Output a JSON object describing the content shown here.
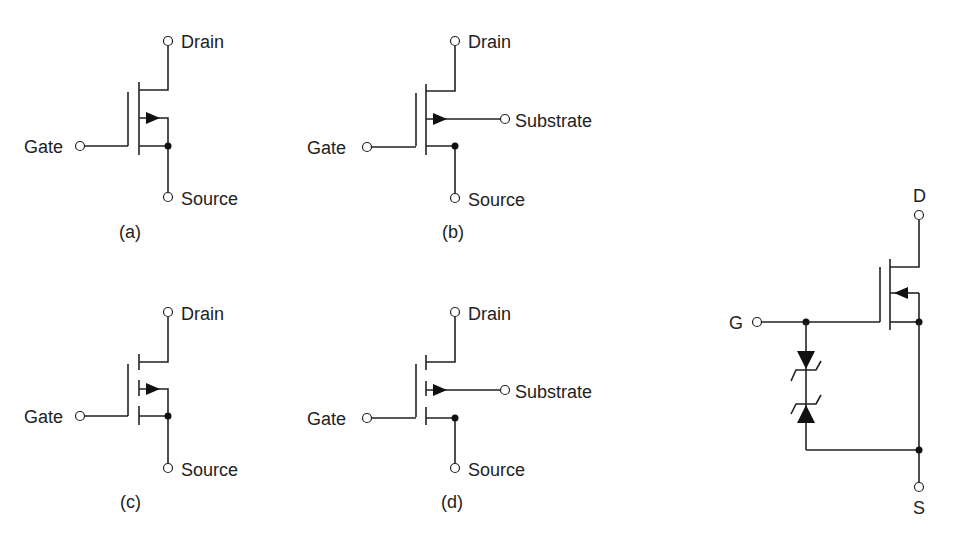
{
  "figure": {
    "symbols": [
      {
        "id": "a",
        "caption": "(a)",
        "description": "Enhancement-type n-channel MOSFET, continuous channel, body tied to source",
        "labels": {
          "drain": "Drain",
          "gate": "Gate",
          "source": "Source"
        }
      },
      {
        "id": "b",
        "caption": "(b)",
        "description": "Enhancement-type n-channel MOSFET, continuous channel, separate substrate terminal",
        "labels": {
          "drain": "Drain",
          "gate": "Gate",
          "source": "Source",
          "substrate": "Substrate"
        }
      },
      {
        "id": "c",
        "caption": "(c)",
        "description": "MOSFET with broken (segmented) channel, body tied to source",
        "labels": {
          "drain": "Drain",
          "gate": "Gate",
          "source": "Source"
        }
      },
      {
        "id": "d",
        "caption": "(d)",
        "description": "MOSFET with broken (segmented) channel, separate substrate terminal",
        "labels": {
          "drain": "Drain",
          "gate": "Gate",
          "source": "Source",
          "substrate": "Substrate"
        }
      },
      {
        "id": "e",
        "caption": "",
        "description": "MOSFET with back-to-back zener diodes gate protection between gate and source",
        "labels": {
          "drain": "D",
          "gate": "G",
          "source": "S"
        }
      }
    ]
  }
}
